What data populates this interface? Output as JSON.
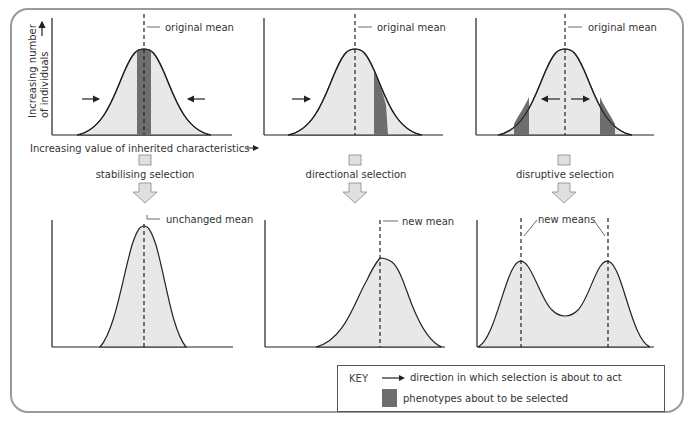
{
  "axes": {
    "y_label_line1": "Increasing number",
    "y_label_line2": "of individuals",
    "x_label": "Increasing value of inherited characteristics"
  },
  "panels": [
    {
      "name": "stabilising",
      "before_label": "original mean",
      "selection_label": "stabilising selection",
      "after_label": "unchanged mean"
    },
    {
      "name": "directional",
      "before_label": "original mean",
      "selection_label": "directional selection",
      "after_label": "new mean"
    },
    {
      "name": "disruptive",
      "before_label": "original mean",
      "selection_label": "disruptive selection",
      "after_label": "new means"
    }
  ],
  "key": {
    "title": "KEY",
    "arrow_text": "direction in which selection is about to act",
    "swatch_text": "phenotypes about to be selected"
  },
  "colors": {
    "curve_fill": "#e8e8e8",
    "selected_band": "#6e6e6e",
    "frame_border": "#9a9a9a"
  }
}
